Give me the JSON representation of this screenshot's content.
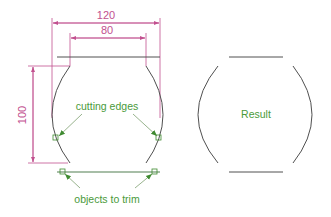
{
  "diagram": {
    "colors": {
      "geometry": "#505050",
      "dimension": "#c2508f",
      "annotation": "#4a9a3a",
      "highlight": "#8aa88a"
    },
    "dimensions": {
      "width_outer": "120",
      "width_inner": "80",
      "height": "100"
    },
    "labels": {
      "cutting_edges": "cutting edges",
      "objects_to_trim": "objects to trim",
      "result": "Result"
    }
  }
}
